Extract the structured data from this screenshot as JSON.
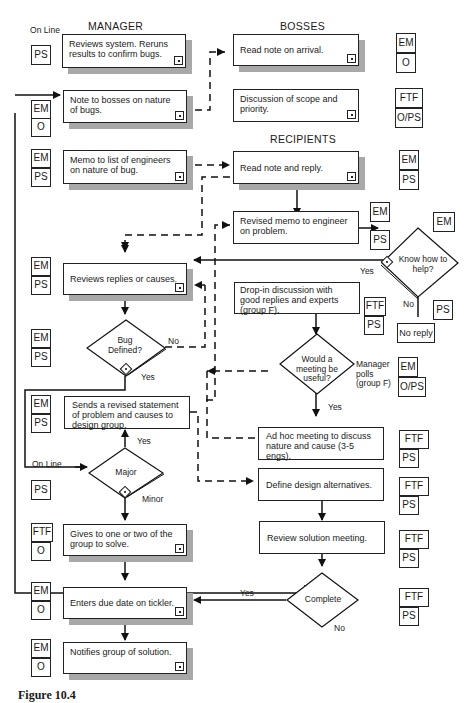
{
  "columns": {
    "manager": "MANAGER",
    "bosses": "BOSSES",
    "recipients": "RECIPIENTS"
  },
  "manager_steps": [
    {
      "text": "Reviews system.  Reruns results to confirm bugs.",
      "media": [
        "PS"
      ],
      "media_note": "On Line"
    },
    {
      "text": "Note to bosses on nature of bugs.",
      "media": [
        "EM",
        "O"
      ]
    },
    {
      "text": "Memo to list of engineers on nature of bug.",
      "media": [
        "EM",
        "PS"
      ]
    },
    {
      "text": "Reviews replies or causes.",
      "media": [
        "EM",
        "PS"
      ]
    },
    {
      "text": "Sends a revised statement of problem and causes to design group.",
      "media": [
        "EM",
        "PS"
      ]
    },
    {
      "text": "Gives to one or two of the group to solve.",
      "media": [
        "FTF",
        "O"
      ]
    },
    {
      "text": "Enters due date on tickler.",
      "media": [
        "EM",
        "O"
      ]
    },
    {
      "text": "Notifies group of solution.",
      "media": [
        "EM",
        "O"
      ]
    }
  ],
  "boss_steps": [
    {
      "text": "Read note on arrival.",
      "media": [
        "EM",
        "O"
      ]
    },
    {
      "text": "Discussion of scope and priority.",
      "media": [
        "FTF",
        "O/PS"
      ]
    }
  ],
  "recipient_steps": [
    {
      "text": "Read note and reply.",
      "media": [
        "EM",
        "PS"
      ]
    },
    {
      "text": "Revised memo to engineer on problem.",
      "media": [
        "EM",
        "PS"
      ]
    },
    {
      "text": "Drop-in discussion with good replies and experts (group F).",
      "media": [
        "FTF",
        "PS"
      ]
    },
    {
      "text": "Ad hoc meeting to discuss nature and cause (3-5 engs).",
      "media": [
        "FTF",
        "PS"
      ]
    },
    {
      "text": "Define design alternatives.",
      "media": [
        "FTF",
        "PS"
      ]
    },
    {
      "text": "Review solution meeting.",
      "media": [
        "FTF",
        "PS"
      ]
    }
  ],
  "decisions": {
    "bug_defined": {
      "text": "Bug Defined?",
      "media": [
        "EM",
        "PS"
      ],
      "yes": "Yes",
      "no": "No"
    },
    "major": {
      "text": "Major",
      "media": [
        "PS"
      ],
      "input_label": "On Line",
      "yes": "Yes",
      "no": "Minor"
    },
    "know_how": {
      "text": "Know how to help?",
      "media": [
        "EM",
        "PS"
      ],
      "yes": "Yes",
      "no": "No"
    },
    "meeting_useful": {
      "text": "Would a meeting be useful?",
      "media": [
        "EM",
        "O/PS"
      ],
      "note": "Manager polls (group F)",
      "yes": "Yes"
    },
    "complete": {
      "text": "Complete",
      "media": [
        "FTF",
        "PS"
      ],
      "yes": "Yes",
      "no": "No"
    }
  },
  "no_reply": "No reply",
  "caption": "Figure 10.4"
}
